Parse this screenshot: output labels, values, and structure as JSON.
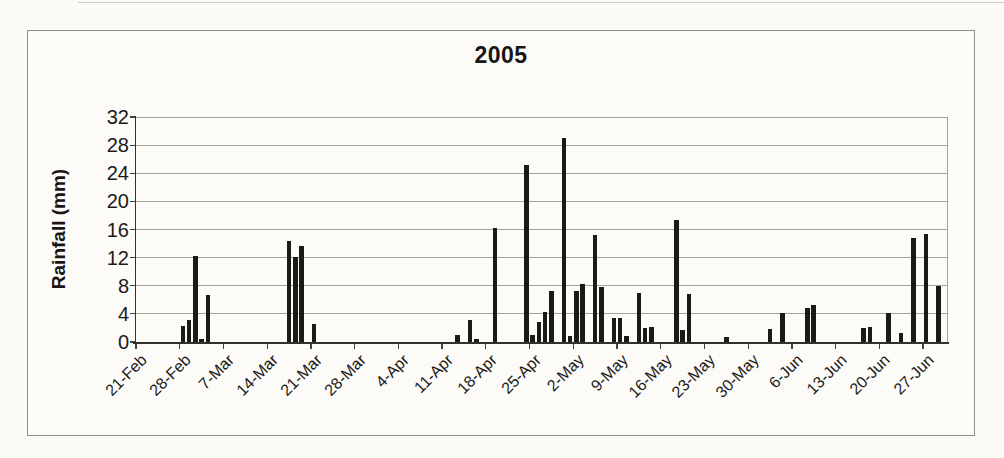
{
  "chart_data": {
    "type": "bar",
    "title": "2005",
    "xlabel": "",
    "ylabel": "Rainfall (mm)",
    "ylim": [
      0,
      32
    ],
    "y_ticks": [
      0,
      4,
      8,
      12,
      16,
      20,
      24,
      28,
      32
    ],
    "x_tick_labels": [
      "21-Feb",
      "28-Feb",
      "7-Mar",
      "14-Mar",
      "21-Mar",
      "28-Mar",
      "4-Apr",
      "11-Apr",
      "18-Apr",
      "25-Apr",
      "2-May",
      "9-May",
      "16-May",
      "23-May",
      "30-May",
      "6-Jun",
      "13-Jun",
      "20-Jun",
      "27-Jun"
    ],
    "x_tick_interval_days": 7,
    "x_start_date": "21-Feb",
    "num_day_slots": 130,
    "grid": "horizontal-gridlines",
    "legend_position": "none",
    "series": [
      {
        "name": "Rainfall (mm)",
        "points": [
          {
            "date": "28-Feb",
            "day": 7,
            "value": 2.3
          },
          {
            "date": "1-Mar",
            "day": 8,
            "value": 3.2
          },
          {
            "date": "2-Mar",
            "day": 9,
            "value": 12.3
          },
          {
            "date": "3-Mar",
            "day": 10,
            "value": 0.5
          },
          {
            "date": "4-Mar",
            "day": 11,
            "value": 6.7
          },
          {
            "date": "17-Mar",
            "day": 24,
            "value": 14.4
          },
          {
            "date": "18-Mar",
            "day": 25,
            "value": 12.1
          },
          {
            "date": "19-Mar",
            "day": 26,
            "value": 13.7
          },
          {
            "date": "21-Mar",
            "day": 28,
            "value": 2.5
          },
          {
            "date": "13-Apr",
            "day": 51,
            "value": 1.0
          },
          {
            "date": "15-Apr",
            "day": 53,
            "value": 3.2
          },
          {
            "date": "16-Apr",
            "day": 54,
            "value": 0.5
          },
          {
            "date": "19-Apr",
            "day": 57,
            "value": 16.2
          },
          {
            "date": "24-Apr",
            "day": 62,
            "value": 25.2
          },
          {
            "date": "25-Apr",
            "day": 63,
            "value": 1.0
          },
          {
            "date": "26-Apr",
            "day": 64,
            "value": 2.9
          },
          {
            "date": "27-Apr",
            "day": 65,
            "value": 4.3
          },
          {
            "date": "28-Apr",
            "day": 66,
            "value": 7.3
          },
          {
            "date": "30-Apr",
            "day": 68,
            "value": 29.0
          },
          {
            "date": "1-May",
            "day": 69,
            "value": 0.9
          },
          {
            "date": "2-May",
            "day": 70,
            "value": 7.2
          },
          {
            "date": "3-May",
            "day": 71,
            "value": 8.2
          },
          {
            "date": "5-May",
            "day": 73,
            "value": 15.2
          },
          {
            "date": "6-May",
            "day": 74,
            "value": 7.9
          },
          {
            "date": "8-May",
            "day": 76,
            "value": 3.4
          },
          {
            "date": "9-May",
            "day": 77,
            "value": 3.4
          },
          {
            "date": "10-May",
            "day": 78,
            "value": 0.9
          },
          {
            "date": "12-May",
            "day": 80,
            "value": 7.0
          },
          {
            "date": "13-May",
            "day": 81,
            "value": 2.0
          },
          {
            "date": "14-May",
            "day": 82,
            "value": 2.1
          },
          {
            "date": "18-May",
            "day": 86,
            "value": 17.4
          },
          {
            "date": "19-May",
            "day": 87,
            "value": 1.7
          },
          {
            "date": "20-May",
            "day": 88,
            "value": 6.8
          },
          {
            "date": "26-May",
            "day": 94,
            "value": 0.7
          },
          {
            "date": "2-Jun",
            "day": 101,
            "value": 1.8
          },
          {
            "date": "4-Jun",
            "day": 103,
            "value": 4.1
          },
          {
            "date": "8-Jun",
            "day": 107,
            "value": 4.9
          },
          {
            "date": "9-Jun",
            "day": 108,
            "value": 5.3
          },
          {
            "date": "17-Jun",
            "day": 116,
            "value": 2.0
          },
          {
            "date": "18-Jun",
            "day": 117,
            "value": 2.2
          },
          {
            "date": "21-Jun",
            "day": 120,
            "value": 4.2
          },
          {
            "date": "23-Jun",
            "day": 122,
            "value": 1.3
          },
          {
            "date": "25-Jun",
            "day": 124,
            "value": 14.8
          },
          {
            "date": "27-Jun",
            "day": 126,
            "value": 15.4
          },
          {
            "date": "29-Jun",
            "day": 128,
            "value": 8.0
          }
        ]
      }
    ]
  },
  "colors": {
    "bar": "#1b1a18",
    "gridline": "#a5a19b",
    "axis": "#33312e",
    "tick": "#454340",
    "text": "#1b1a18",
    "background": "#fbfaf7",
    "box_border": "#8f8e8a",
    "plot_right_border": "#a5a19b"
  }
}
